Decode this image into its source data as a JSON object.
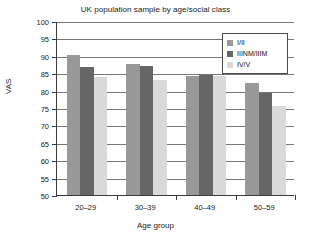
{
  "chart_data": {
    "type": "bar",
    "title": "UK population sample by age/social class",
    "xlabel": "Age group",
    "ylabel": "VAS",
    "categories": [
      "20–29",
      "30–39",
      "40–49",
      "50–59"
    ],
    "series": [
      {
        "name": "I/II",
        "color": "#999999",
        "values": [
          90.1,
          87.6,
          84.3,
          82.1
        ]
      },
      {
        "name": "IIINM/IIIM",
        "color": "#666666",
        "values": [
          86.8,
          87.0,
          84.4,
          79.2
        ]
      },
      {
        "name": "IV/V",
        "color": "#d9d9d9",
        "values": [
          83.9,
          83.1,
          84.3,
          75.5
        ]
      }
    ],
    "ylim": [
      50,
      100
    ],
    "yticks": [
      50,
      55,
      60,
      65,
      70,
      75,
      80,
      85,
      90,
      95,
      100
    ],
    "ytick_labels": [
      "50",
      "55",
      "60",
      "65",
      "70",
      "75",
      "80",
      "85",
      "90",
      "95",
      "100"
    ],
    "grid": true,
    "legend_position": "top-right",
    "legend_entries": [
      "I/II",
      "IIINM/IIIM",
      "IV/V"
    ]
  }
}
